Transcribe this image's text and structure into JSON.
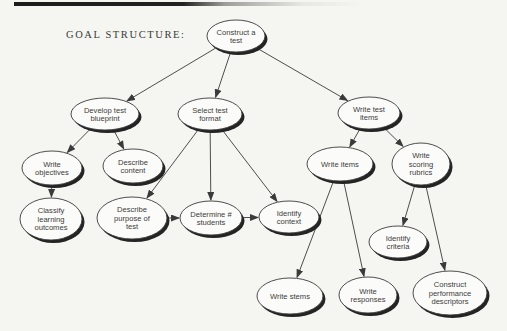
{
  "page": {
    "heading": "GOAL STRUCTURE:",
    "paper_color": "#f5f5f1",
    "ink_color": "#3a3a3a",
    "shadow_color": "#242424",
    "node_fill": "#fbfbf9"
  },
  "diagram": {
    "type": "goal-structure-tree",
    "nodes": [
      {
        "id": "construct-test",
        "label": "Construct a test",
        "lines": [
          "Construct a",
          "test"
        ],
        "cx": 236,
        "cy": 36,
        "rx": 29,
        "ry": 16
      },
      {
        "id": "develop-blueprint",
        "label": "Develop test blueprint",
        "lines": [
          "Develop test",
          "blueprint"
        ],
        "cx": 105,
        "cy": 114,
        "rx": 34,
        "ry": 16
      },
      {
        "id": "select-format",
        "label": "Select test format",
        "lines": [
          "Select test",
          "format"
        ],
        "cx": 210,
        "cy": 114,
        "rx": 32,
        "ry": 16
      },
      {
        "id": "write-test-items",
        "label": "Write test items",
        "lines": [
          "Write test",
          "items"
        ],
        "cx": 369,
        "cy": 113,
        "rx": 31,
        "ry": 16
      },
      {
        "id": "write-objectives",
        "label": "Write objectives",
        "lines": [
          "Write",
          "objectives"
        ],
        "cx": 52,
        "cy": 168,
        "rx": 30,
        "ry": 17
      },
      {
        "id": "describe-content",
        "label": "Describe content",
        "lines": [
          "Describe",
          "content"
        ],
        "cx": 133,
        "cy": 166,
        "rx": 30,
        "ry": 17
      },
      {
        "id": "classify-outcomes",
        "label": "Classify learning outcomes",
        "lines": [
          "Classify",
          "learning",
          "outcomes"
        ],
        "cx": 51,
        "cy": 219,
        "rx": 31,
        "ry": 21
      },
      {
        "id": "describe-purpose",
        "label": "Describe purpose of test",
        "lines": [
          "Describe",
          "purpose of",
          "test"
        ],
        "cx": 132,
        "cy": 218,
        "rx": 35,
        "ry": 21
      },
      {
        "id": "determine-students",
        "label": "Determine # students",
        "lines": [
          "Determine #",
          "students"
        ],
        "cx": 211,
        "cy": 218,
        "rx": 31,
        "ry": 17
      },
      {
        "id": "identify-context",
        "label": "Identify context",
        "lines": [
          "Identify",
          "context"
        ],
        "cx": 289,
        "cy": 217,
        "rx": 30,
        "ry": 16
      },
      {
        "id": "write-items",
        "label": "Write items",
        "lines": [
          "Write items"
        ],
        "cx": 340,
        "cy": 164,
        "rx": 33,
        "ry": 17
      },
      {
        "id": "write-scoring-rubrics",
        "label": "Write scoring rubrics",
        "lines": [
          "Write",
          "scoring",
          "rubrics"
        ],
        "cx": 421,
        "cy": 164,
        "rx": 29,
        "ry": 21
      },
      {
        "id": "identify-criteria",
        "label": "Identify criteria",
        "lines": [
          "Identify",
          "criteria"
        ],
        "cx": 398,
        "cy": 242,
        "rx": 29,
        "ry": 16
      },
      {
        "id": "write-stems",
        "label": "Write stems",
        "lines": [
          "Write stems"
        ],
        "cx": 290,
        "cy": 296,
        "rx": 33,
        "ry": 18
      },
      {
        "id": "write-responses",
        "label": "Write responses",
        "lines": [
          "Write",
          "responses"
        ],
        "cx": 368,
        "cy": 295,
        "rx": 29,
        "ry": 18
      },
      {
        "id": "construct-descriptors",
        "label": "Construct performance descriptors",
        "lines": [
          "Construct",
          "performance",
          "descriptors"
        ],
        "cx": 450,
        "cy": 293,
        "rx": 37,
        "ry": 22
      }
    ],
    "edges": [
      {
        "from": "construct-test",
        "to": "develop-blueprint"
      },
      {
        "from": "construct-test",
        "to": "select-format"
      },
      {
        "from": "construct-test",
        "to": "write-test-items"
      },
      {
        "from": "develop-blueprint",
        "to": "write-objectives"
      },
      {
        "from": "develop-blueprint",
        "to": "describe-content"
      },
      {
        "from": "write-objectives",
        "to": "classify-outcomes"
      },
      {
        "from": "select-format",
        "to": "describe-purpose"
      },
      {
        "from": "select-format",
        "to": "determine-students"
      },
      {
        "from": "select-format",
        "to": "identify-context"
      },
      {
        "from": "describe-purpose",
        "to": "determine-students"
      },
      {
        "from": "determine-students",
        "to": "identify-context"
      },
      {
        "from": "write-test-items",
        "to": "write-items"
      },
      {
        "from": "write-test-items",
        "to": "write-scoring-rubrics"
      },
      {
        "from": "write-items",
        "to": "write-stems"
      },
      {
        "from": "write-items",
        "to": "write-responses"
      },
      {
        "from": "write-scoring-rubrics",
        "to": "identify-criteria"
      },
      {
        "from": "write-scoring-rubrics",
        "to": "construct-descriptors"
      }
    ]
  }
}
